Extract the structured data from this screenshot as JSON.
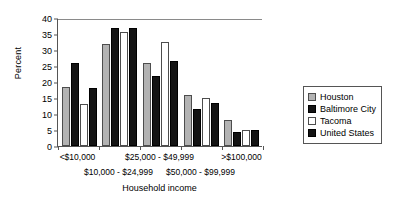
{
  "chart_data": {
    "type": "bar",
    "title": "",
    "xlabel": "Household income",
    "ylabel": "Percent",
    "ylim": [
      0,
      40
    ],
    "yticks": [
      0,
      5,
      10,
      15,
      20,
      25,
      30,
      35,
      40
    ],
    "grid": false,
    "legend_position": "right",
    "categories": [
      "<$10,000",
      "$10,000 - $24,999",
      "$25,000 - $49,999",
      "$50,000 - $99,999",
      ">$100,000"
    ],
    "series": [
      {
        "name": "Houston",
        "color": "#b3b3b3",
        "values": [
          18.5,
          32.0,
          26.0,
          16.0,
          8.0
        ]
      },
      {
        "name": "Baltimore City",
        "color": "#141414",
        "values": [
          26.0,
          37.0,
          22.0,
          11.5,
          4.5
        ]
      },
      {
        "name": "Tacoma",
        "color": "#ffffff",
        "values": [
          13.0,
          35.5,
          32.5,
          15.0,
          5.0
        ]
      },
      {
        "name": "United States",
        "color": "#141414",
        "values": [
          18.0,
          37.0,
          26.5,
          13.5,
          5.0
        ]
      }
    ]
  },
  "legend": {
    "entries": [
      {
        "label": "Houston"
      },
      {
        "label": "Baltimore City"
      },
      {
        "label": "Tacoma"
      },
      {
        "label": "United States"
      }
    ]
  }
}
